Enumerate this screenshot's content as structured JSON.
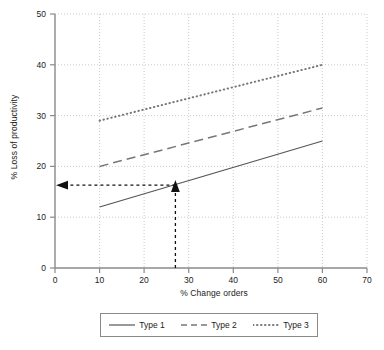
{
  "chart_data": {
    "type": "line",
    "title": "",
    "xlabel": "% Change orders",
    "ylabel": "% Loss of productivity",
    "xlim": [
      0,
      70
    ],
    "ylim": [
      0,
      50
    ],
    "xticks": [
      0,
      10,
      20,
      30,
      40,
      50,
      60,
      70
    ],
    "yticks": [
      0,
      10,
      20,
      30,
      40,
      50
    ],
    "xtick_labels": [
      "0",
      "10",
      "20",
      "30",
      "40",
      "50",
      "60",
      "70"
    ],
    "ytick_labels": [
      "0",
      "10",
      "20",
      "30",
      "40",
      "50"
    ],
    "grid": true,
    "grid_style": "dotted",
    "legend_position": "bottom",
    "series": [
      {
        "name": "Type 1",
        "style": "solid",
        "color": "#555555",
        "x": [
          10,
          60
        ],
        "y": [
          12,
          25
        ]
      },
      {
        "name": "Type 2",
        "style": "dashed",
        "color": "#777777",
        "x": [
          10,
          60
        ],
        "y": [
          20,
          31.5
        ]
      },
      {
        "name": "Type 3",
        "style": "dotted",
        "color": "#777777",
        "x": [
          10,
          60
        ],
        "y": [
          29,
          40
        ]
      }
    ],
    "annotations": [
      {
        "name": "vertical-indicator",
        "style": "dashed-arrow-up",
        "from": {
          "x": 27,
          "y": 0
        },
        "to": {
          "x": 27,
          "y": 16.3
        },
        "color": "#111111"
      },
      {
        "name": "horizontal-indicator",
        "style": "dashed-arrow-left",
        "from": {
          "x": 27,
          "y": 16.3
        },
        "to": {
          "x": 0,
          "y": 16.3
        },
        "color": "#111111"
      }
    ]
  },
  "legend": {
    "entries": [
      {
        "label": "Type 1",
        "style": "solid"
      },
      {
        "label": "Type 2",
        "style": "dashed"
      },
      {
        "label": "Type 3",
        "style": "dotted"
      }
    ]
  },
  "colors": {
    "axis": "#8a8a8a",
    "grid": "#bdbdbd",
    "text": "#222222",
    "series1": "#555555",
    "series2": "#777777",
    "series3": "#777777",
    "annotation": "#111111",
    "legend_border": "#8a8a8a"
  }
}
